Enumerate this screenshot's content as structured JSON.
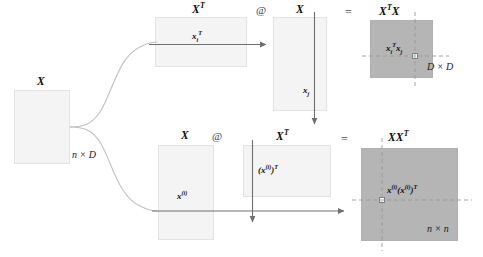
{
  "figure": {
    "background_color": "#ffffff",
    "light_block_color": "#f4f4f4",
    "dark_block_color": "#b5b5b5",
    "block_border_color": "#e3e3e3",
    "connector_color": "#b9b9b9",
    "arrow_color": "#6f6f6f",
    "dashed_guide_color": "#9a9a9a"
  },
  "source_matrix": {
    "label": "X",
    "dims": "n × D"
  },
  "operator": {
    "matmul": "@",
    "equals": "="
  },
  "top_row": {
    "left_factor": {
      "label_base": "X",
      "label_sup": "T",
      "inner_base": "x",
      "inner_sub": "i",
      "inner_sup": "T"
    },
    "right_factor": {
      "label": "X",
      "inner_base": "x",
      "inner_sub": "j"
    },
    "result": {
      "label_base": "X",
      "label_sup": "T",
      "label_tail": "X",
      "inner_1_base": "x",
      "inner_1_sub": "i",
      "inner_1_sup": "T",
      "inner_2_base": "x",
      "inner_2_sub": "j",
      "dims": "D × D"
    }
  },
  "bottom_row": {
    "left_factor": {
      "label": "X",
      "inner_base": "x",
      "inner_sup": "(i)"
    },
    "right_factor": {
      "label_base": "X",
      "label_sup": "T",
      "inner_open": "(",
      "inner_base": "x",
      "inner_sup_idx": "(i)",
      "inner_close": ")",
      "inner_sup_t": "T"
    },
    "result": {
      "label_base": "XX",
      "label_sup": "T",
      "inner_a_base": "x",
      "inner_a_sup": "(i)",
      "inner_b_open": "(",
      "inner_b_base": "x",
      "inner_b_sup_idx": "(i)",
      "inner_b_close": ")",
      "inner_b_sup_t": "T",
      "dims": "n × n"
    }
  }
}
